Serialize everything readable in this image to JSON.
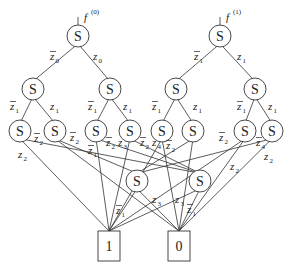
{
  "diagram": {
    "type": "binary decision diagram",
    "roots": [
      {
        "id": "r0",
        "label": "f",
        "superscript": "(0)"
      },
      {
        "id": "r1",
        "label": "f",
        "superscript": "(1)"
      }
    ],
    "node_label": "S",
    "nodes": [
      {
        "id": "r0",
        "x": 78,
        "y": 36
      },
      {
        "id": "r1",
        "x": 220,
        "y": 36
      },
      {
        "id": "a1",
        "x": 33,
        "y": 89
      },
      {
        "id": "a2",
        "x": 110,
        "y": 89
      },
      {
        "id": "b1",
        "x": 176,
        "y": 89
      },
      {
        "id": "b2",
        "x": 255,
        "y": 89
      },
      {
        "id": "c1",
        "x": 20,
        "y": 131
      },
      {
        "id": "c2",
        "x": 55,
        "y": 131
      },
      {
        "id": "c3",
        "x": 96,
        "y": 131
      },
      {
        "id": "c4",
        "x": 130,
        "y": 131
      },
      {
        "id": "c5",
        "x": 162,
        "y": 131
      },
      {
        "id": "c6",
        "x": 193,
        "y": 131
      },
      {
        "id": "c7",
        "x": 245,
        "y": 131
      },
      {
        "id": "c8",
        "x": 272,
        "y": 131
      },
      {
        "id": "d1",
        "x": 137,
        "y": 181
      },
      {
        "id": "d2",
        "x": 200,
        "y": 181
      }
    ],
    "terminals": [
      {
        "id": "t1",
        "label": "1",
        "x": 109,
        "y": 246
      },
      {
        "id": "t0",
        "label": "0",
        "x": 179,
        "y": 246
      }
    ],
    "edges": [
      {
        "from": "r0",
        "to": "a1"
      },
      {
        "from": "r0",
        "to": "a2"
      },
      {
        "from": "r1",
        "to": "b1"
      },
      {
        "from": "r1",
        "to": "b2"
      },
      {
        "from": "a1",
        "to": "c1"
      },
      {
        "from": "a1",
        "to": "c2"
      },
      {
        "from": "a2",
        "to": "c3"
      },
      {
        "from": "a2",
        "to": "c4"
      },
      {
        "from": "b1",
        "to": "c5"
      },
      {
        "from": "b1",
        "to": "c6"
      },
      {
        "from": "b2",
        "to": "c7"
      },
      {
        "from": "b2",
        "to": "c8"
      },
      {
        "from": "c1",
        "to": "t1"
      },
      {
        "from": "c1",
        "to": "d2"
      },
      {
        "from": "c2",
        "to": "t0"
      },
      {
        "from": "c2",
        "to": "d1"
      },
      {
        "from": "c3",
        "to": "t1"
      },
      {
        "from": "c3",
        "to": "d2"
      },
      {
        "from": "c4",
        "to": "t1"
      },
      {
        "from": "c4",
        "to": "d2"
      },
      {
        "from": "c5",
        "to": "t0"
      },
      {
        "from": "c5",
        "to": "t1"
      },
      {
        "from": "c6",
        "to": "t0"
      },
      {
        "from": "c6",
        "to": "d1"
      },
      {
        "from": "c7",
        "to": "t0"
      },
      {
        "from": "c7",
        "to": "t1"
      },
      {
        "from": "c8",
        "to": "t0"
      },
      {
        "from": "c8",
        "to": "d1"
      },
      {
        "from": "d1",
        "to": "t1"
      },
      {
        "from": "d1",
        "to": "t0"
      },
      {
        "from": "d2",
        "to": "t0"
      },
      {
        "from": "d2",
        "to": "t1"
      }
    ],
    "edge_labels": [
      {
        "text": "z",
        "sub": "0",
        "bar": true,
        "x": 50,
        "y": 60
      },
      {
        "text": "z",
        "sub": "0",
        "bar": false,
        "x": 93,
        "y": 60
      },
      {
        "text": "z",
        "sub": "1",
        "bar": true,
        "x": 194,
        "y": 60
      },
      {
        "text": "z",
        "sub": "1",
        "bar": false,
        "x": 237,
        "y": 60
      },
      {
        "text": "z",
        "sub": "1",
        "bar": true,
        "x": 10,
        "y": 110
      },
      {
        "text": "z",
        "sub": "1",
        "bar": false,
        "x": 50,
        "y": 110
      },
      {
        "text": "z",
        "sub": "1",
        "bar": true,
        "x": 88,
        "y": 110
      },
      {
        "text": "z",
        "sub": "1",
        "bar": false,
        "x": 123,
        "y": 110
      },
      {
        "text": "z",
        "sub": "1",
        "bar": true,
        "x": 152,
        "y": 110
      },
      {
        "text": "z",
        "sub": "1",
        "bar": false,
        "x": 193,
        "y": 110
      },
      {
        "text": "z",
        "sub": "1",
        "bar": true,
        "x": 237,
        "y": 110
      },
      {
        "text": "z",
        "sub": "1",
        "bar": false,
        "x": 268,
        "y": 110
      },
      {
        "text": "z",
        "sub": "2",
        "bar": false,
        "x": 18,
        "y": 158
      },
      {
        "text": "z",
        "sub": "2",
        "bar": true,
        "x": 34,
        "y": 142
      },
      {
        "text": "z",
        "sub": "2",
        "bar": true,
        "x": 70,
        "y": 141
      },
      {
        "text": "z",
        "sub": "1",
        "bar": true,
        "x": 88,
        "y": 154
      },
      {
        "text": "z",
        "sub": "2",
        "bar": true,
        "x": 106,
        "y": 146
      },
      {
        "text": "z",
        "sub": "3",
        "bar": false,
        "x": 118,
        "y": 146
      },
      {
        "text": "z",
        "sub": "2",
        "bar": true,
        "x": 140,
        "y": 146
      },
      {
        "text": "z",
        "sub": "4",
        "bar": false,
        "x": 152,
        "y": 146
      },
      {
        "text": "z",
        "sub": "2",
        "bar": true,
        "x": 166,
        "y": 149
      },
      {
        "text": "z",
        "sub": "2",
        "bar": true,
        "x": 219,
        "y": 141
      },
      {
        "text": "z",
        "sub": "4",
        "bar": true,
        "x": 256,
        "y": 146
      },
      {
        "text": "z",
        "sub": "2",
        "bar": false,
        "x": 264,
        "y": 160
      },
      {
        "text": "z",
        "sub": "2",
        "bar": false,
        "x": 230,
        "y": 170
      },
      {
        "text": "z",
        "sub": "3",
        "bar": false,
        "x": 152,
        "y": 203
      },
      {
        "text": "z",
        "sub": "3",
        "bar": false,
        "x": 175,
        "y": 203
      },
      {
        "text": "z",
        "sub": "1",
        "bar": true,
        "x": 116,
        "y": 214
      },
      {
        "text": "z",
        "sub": "1",
        "bar": true,
        "x": 187,
        "y": 213
      }
    ],
    "node_radius": 11,
    "stroke_color": "#333333"
  }
}
